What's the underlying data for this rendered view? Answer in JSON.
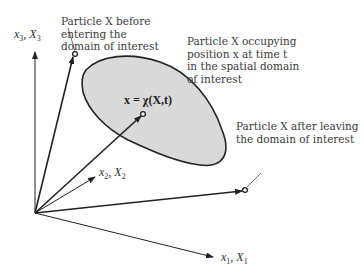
{
  "diagram": {
    "axes": {
      "x3": {
        "var": "x",
        "cap": "X",
        "sub": "3"
      },
      "x2": {
        "var": "x",
        "cap": "X",
        "sub": "2"
      },
      "x1": {
        "var": "x",
        "cap": "X",
        "sub": "1"
      }
    },
    "labels": {
      "before": [
        "Particle X before",
        "entering the",
        "domain of interest"
      ],
      "occupying": [
        "Particle X occupying",
        "position x at time t",
        "in the spatial domain",
        "of interest"
      ],
      "after": [
        "Particle X after leaving",
        "the domain of interest"
      ]
    },
    "equation": "x = χ(X,t)",
    "colors": {
      "domain_fill": "#d9d9d9",
      "stroke": "#222222"
    }
  }
}
